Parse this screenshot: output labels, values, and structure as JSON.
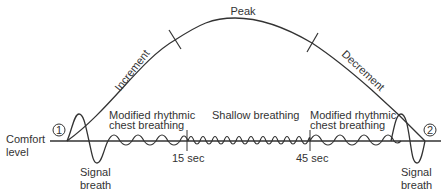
{
  "diagram": {
    "labels": {
      "peak": "Peak",
      "increment": "Increment",
      "decrement": "Decrement",
      "comfort_level_line1": "Comfort",
      "comfort_level_line2": "level",
      "modified_left_line1": "Modified rhythmic",
      "modified_left_line2": "chest breathing",
      "shallow": "Shallow breathing",
      "modified_right_line1": "Modified rhythmic",
      "modified_right_line2": "chest breathing",
      "signal_left_line1": "Signal",
      "signal_left_line2": "breath",
      "signal_right_line1": "Signal",
      "signal_right_line2": "breath",
      "time_15": "15 sec",
      "time_45": "45 sec",
      "marker_1": "1",
      "marker_2": "2"
    },
    "colors": {
      "stroke": "#333333",
      "background": "#ffffff"
    }
  }
}
